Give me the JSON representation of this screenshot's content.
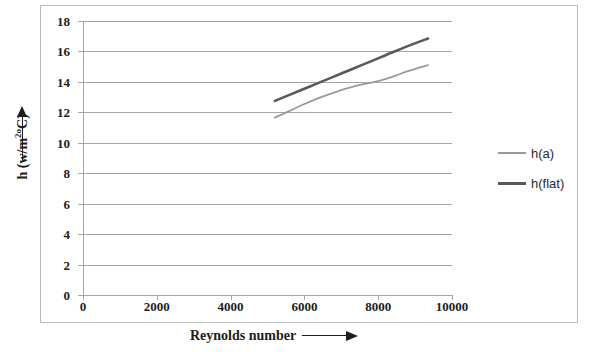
{
  "chart_data": {
    "type": "line",
    "title": "",
    "xlabel": "Reynolds number",
    "ylabel": "h (w/m2oC)",
    "ylabel_parts": {
      "prefix": "h (w/m",
      "sup": "2o",
      "suffix": "C)"
    },
    "xlabel_arrow": "arrow-right",
    "ylabel_arrow": "arrow-up",
    "xlim": [
      0,
      10000
    ],
    "ylim": [
      0,
      18
    ],
    "xticks": [
      0,
      2000,
      4000,
      6000,
      8000,
      10000
    ],
    "xtick_labels": [
      "0",
      "2000",
      "4000",
      "6000",
      "8000",
      "10000"
    ],
    "yticks": [
      0,
      2,
      4,
      6,
      8,
      10,
      12,
      14,
      16,
      18
    ],
    "ytick_labels": [
      "0",
      "2",
      "4",
      "6",
      "8",
      "10",
      "12",
      "14",
      "16",
      "18"
    ],
    "grid": "horizontal",
    "grid_color": "#a6a6a6",
    "legend_position": "right",
    "series": [
      {
        "name": "h(a)",
        "color": "#9a9a9a",
        "width": 1.8,
        "x": [
          5200,
          5600,
          6000,
          6400,
          6800,
          7200,
          7600,
          8000,
          8400,
          8800,
          9350
        ],
        "y": [
          11.65,
          12.1,
          12.55,
          12.95,
          13.3,
          13.6,
          13.85,
          14.05,
          14.35,
          14.7,
          15.1
        ]
      },
      {
        "name": "h(flat)",
        "color": "#595959",
        "width": 2.6,
        "x": [
          5200,
          5800,
          6400,
          7000,
          7600,
          8200,
          8800,
          9350
        ],
        "y": [
          12.75,
          13.35,
          13.95,
          14.55,
          15.15,
          15.75,
          16.35,
          16.85
        ]
      }
    ]
  },
  "legend": {
    "items": [
      {
        "label": "h(a)",
        "color": "#9a9a9a",
        "thickness": "2px"
      },
      {
        "label": "h(flat)",
        "color": "#595959",
        "thickness": "3px"
      }
    ]
  }
}
